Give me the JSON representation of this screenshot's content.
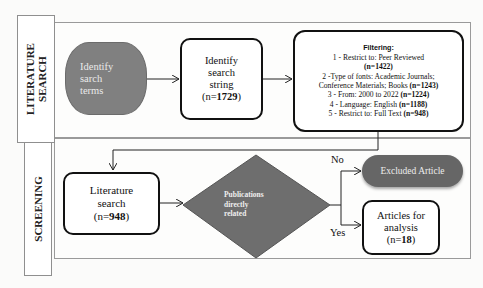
{
  "sections": {
    "literature_search": {
      "label_line1": "LITERATURE",
      "label_line2": "SEARCH"
    },
    "screening": {
      "label": "SCREENING"
    }
  },
  "nodes": {
    "identify_terms": {
      "line1": "Identify",
      "line2": "sarch",
      "line3": "terms"
    },
    "identify_string": {
      "line1": "Identify",
      "line2": "search",
      "line3": "string",
      "count_prefix": "(n=",
      "count": "1729",
      "count_suffix": ")"
    },
    "filtering": {
      "title": "Filtering:",
      "items": [
        {
          "text": "1 - Restrict to: Peer Reviewed",
          "count": "(n=1422)"
        },
        {
          "text": "2 -Type of fonts: Academic Journals;",
          "text2": "Conference Materials; Books",
          "count": "(n=1243)"
        },
        {
          "text": "3 - From: 2000 to 2022",
          "count": "(n=1224)"
        },
        {
          "text": "4 - Language: English",
          "count": "(n=1188)"
        },
        {
          "text": "5 - Restrict to: Full Text",
          "count": "(n=948)"
        }
      ]
    },
    "literature_search": {
      "line1": "Literature",
      "line2": "search",
      "count_prefix": "(n=",
      "count": "948",
      "count_suffix": ")"
    },
    "decision": {
      "line1": "Publications",
      "line2": "directly",
      "line3": "related"
    },
    "excluded": {
      "label": "Excluded Article"
    },
    "articles": {
      "line1": "Articles for",
      "line2": "analysis",
      "count_prefix": "(n=",
      "count": "18",
      "count_suffix": ")"
    }
  },
  "edges": {
    "no_label": "No",
    "yes_label": "Yes"
  },
  "colors": {
    "gray_node": "#808080",
    "decision_fill": "#6e6e6e",
    "excluded_fill": "#666666",
    "frame_border": "#9a9a9a"
  }
}
